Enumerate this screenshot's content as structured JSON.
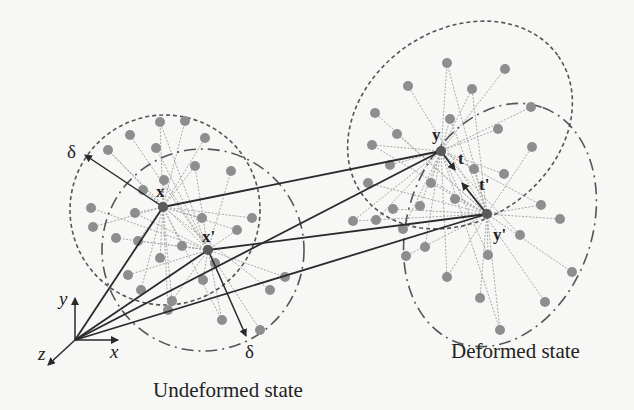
{
  "figure": {
    "captions": {
      "undeformed": "Undeformed state",
      "deformed": "Deformed state"
    },
    "points": {
      "x": "x",
      "x_prime": "x'",
      "y": "y",
      "y_prime": "y'"
    },
    "vectors": {
      "t": "t",
      "t_prime": "t'",
      "delta_upper": "δ",
      "delta_lower": "δ"
    },
    "axes": {
      "x": "x",
      "y": "y",
      "z": "z"
    },
    "colors": {
      "background": "#f7f7f5",
      "dot": "#8e8e8e",
      "center_dot": "#5a5a5a",
      "bond_line": "#a8a8a8",
      "main_line": "#2a2a2a",
      "horizon": "#555555"
    }
  }
}
